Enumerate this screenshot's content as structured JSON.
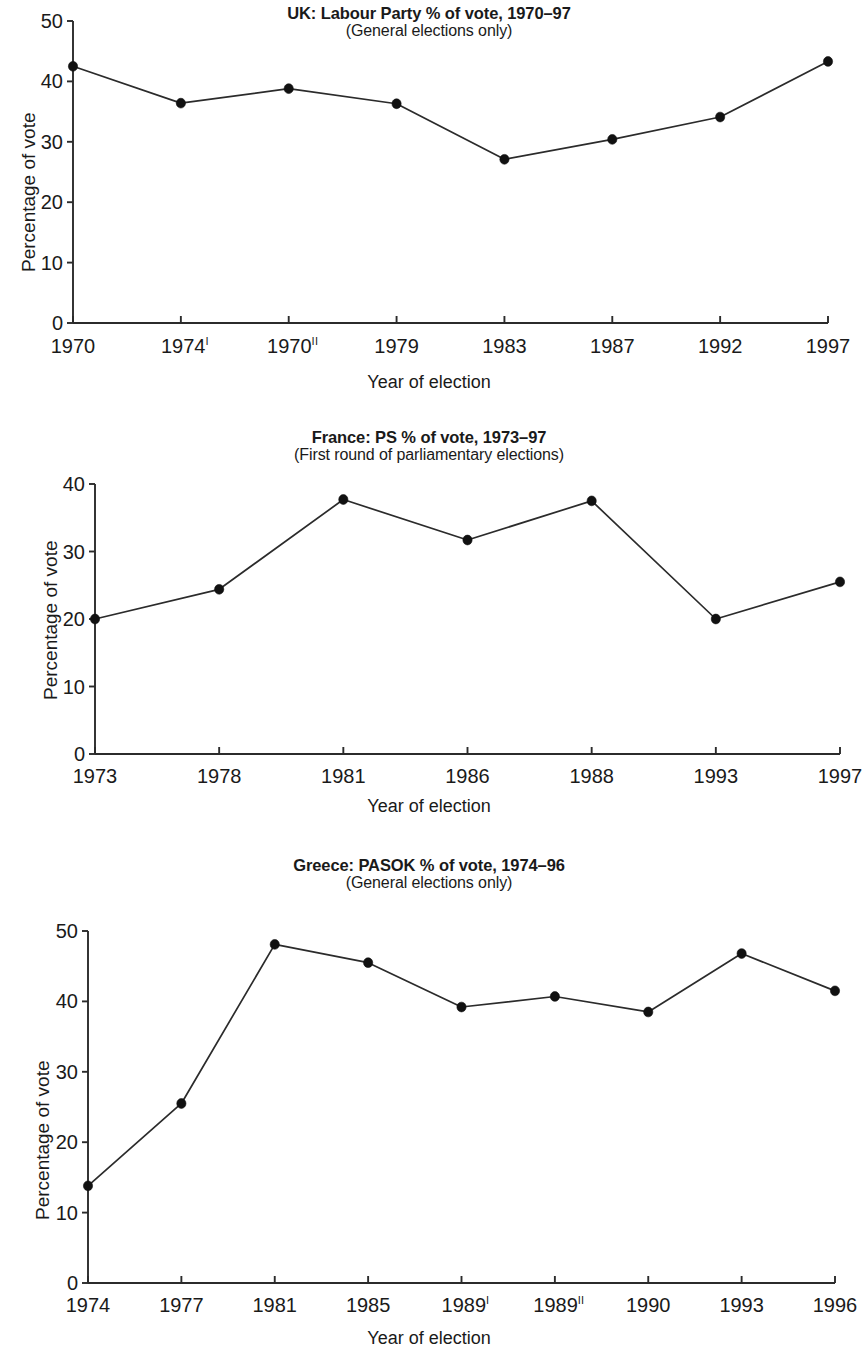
{
  "page": {
    "background": "#ffffff",
    "ink": "#2b2b2b"
  },
  "figures": [
    {
      "id": "uk",
      "title": "UK: Labour Party % of vote, 1970–97",
      "subtitle": "(General elections only)",
      "xlabel": "Year of election",
      "ylabel": "Percentage of vote"
    },
    {
      "id": "france",
      "title": "France: PS % of vote, 1973–97",
      "subtitle": "(First round of parliamentary elections)",
      "xlabel": "Year of election",
      "ylabel": "Percentage of vote"
    },
    {
      "id": "greece",
      "title": "Greece: PASOK % of vote, 1974–96",
      "subtitle": "(General  elections only)",
      "xlabel": "Year of election",
      "ylabel": "Percentage of vote"
    }
  ],
  "chart_data": [
    {
      "type": "line",
      "title": "UK: Labour Party % of vote, 1970–97",
      "subtitle": "(General elections only)",
      "xlabel": "Year of election",
      "ylabel": "Percentage of vote",
      "categories": [
        "1970",
        "1974I",
        "1970II",
        "1979",
        "1983",
        "1987",
        "1992",
        "1997"
      ],
      "tick_labels": [
        {
          "text": "1970",
          "sup": ""
        },
        {
          "text": "1974",
          "sup": "I"
        },
        {
          "text": "1970",
          "sup": "II"
        },
        {
          "text": "1979",
          "sup": ""
        },
        {
          "text": "1983",
          "sup": ""
        },
        {
          "text": "1987",
          "sup": ""
        },
        {
          "text": "1992",
          "sup": ""
        },
        {
          "text": "1997",
          "sup": ""
        }
      ],
      "values": [
        42.5,
        36.4,
        38.8,
        36.3,
        27.1,
        30.4,
        34.1,
        43.3
      ],
      "ylim": [
        0,
        50
      ],
      "yticks": [
        0,
        10,
        20,
        30,
        40,
        50
      ],
      "grid": false,
      "legend": "none",
      "marker": "filled-circle",
      "line_color": "#2b2b2b"
    },
    {
      "type": "line",
      "title": "France: PS % of vote, 1973–97",
      "subtitle": "(First round of parliamentary elections)",
      "xlabel": "Year of election",
      "ylabel": "Percentage of vote",
      "categories": [
        "1973",
        "1978",
        "1981",
        "1986",
        "1988",
        "1993",
        "1997"
      ],
      "tick_labels": [
        {
          "text": "1973",
          "sup": ""
        },
        {
          "text": "1978",
          "sup": ""
        },
        {
          "text": "1981",
          "sup": ""
        },
        {
          "text": "1986",
          "sup": ""
        },
        {
          "text": "1988",
          "sup": ""
        },
        {
          "text": "1993",
          "sup": ""
        },
        {
          "text": "1997",
          "sup": ""
        }
      ],
      "values": [
        20.0,
        24.4,
        37.7,
        31.7,
        37.5,
        20.0,
        25.5
      ],
      "ylim": [
        0,
        40
      ],
      "yticks": [
        0,
        10,
        20,
        30,
        40
      ],
      "grid": false,
      "legend": "none",
      "marker": "filled-circle",
      "line_color": "#2b2b2b"
    },
    {
      "type": "line",
      "title": "Greece: PASOK % of vote, 1974–96",
      "subtitle": "(General  elections only)",
      "xlabel": "Year of election",
      "ylabel": "Percentage of vote",
      "categories": [
        "1974",
        "1977",
        "1981",
        "1985",
        "1989I",
        "1989II",
        "1990",
        "1993",
        "1996"
      ],
      "tick_labels": [
        {
          "text": "1974",
          "sup": ""
        },
        {
          "text": "1977",
          "sup": ""
        },
        {
          "text": "1981",
          "sup": ""
        },
        {
          "text": "1985",
          "sup": ""
        },
        {
          "text": "1989",
          "sup": "I"
        },
        {
          "text": "1989",
          "sup": "II"
        },
        {
          "text": "1990",
          "sup": ""
        },
        {
          "text": "1993",
          "sup": ""
        },
        {
          "text": "1996",
          "sup": ""
        }
      ],
      "values": [
        13.8,
        25.5,
        48.1,
        45.5,
        39.2,
        40.7,
        38.5,
        46.8,
        41.5
      ],
      "ylim": [
        0,
        50
      ],
      "yticks": [
        0,
        10,
        20,
        30,
        40,
        50
      ],
      "grid": false,
      "legend": "none",
      "marker": "filled-circle",
      "line_color": "#2b2b2b"
    }
  ],
  "geometry": [
    {
      "x0": 73,
      "x1": 828,
      "yTop": 21,
      "yBase": 323,
      "titleTop": 4,
      "subTop": 24,
      "xLabelTop": 336,
      "axisTitleTop": 372,
      "yLabelLeft": 18,
      "yLabelTop": 272
    },
    {
      "x0": 95,
      "x1": 840,
      "yTop": 484,
      "yBase": 754,
      "titleTop": 428,
      "subTop": 449,
      "xLabelTop": 766,
      "axisTitleTop": 796,
      "yLabelLeft": 40,
      "yLabelTop": 700
    },
    {
      "x0": 88,
      "x1": 835,
      "yTop": 931,
      "yBase": 1283,
      "titleTop": 856,
      "subTop": 877,
      "xLabelTop": 1295,
      "axisTitleTop": 1328,
      "yLabelLeft": 32,
      "yLabelTop": 1220
    }
  ]
}
